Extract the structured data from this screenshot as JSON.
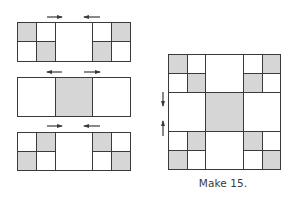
{
  "colors": {
    "line": "#3a3a3a",
    "fill_gray": "#d6d6d6",
    "fill_white": "#ffffff"
  },
  "rows": [
    {
      "name": "row-1",
      "cells": [
        {
          "x": 17,
          "y": 22,
          "w": 19,
          "h": 19,
          "fill": "gray"
        },
        {
          "x": 36,
          "y": 22,
          "w": 19,
          "h": 19,
          "fill": "white"
        },
        {
          "x": 17,
          "y": 41,
          "w": 19,
          "h": 20,
          "fill": "white"
        },
        {
          "x": 36,
          "y": 41,
          "w": 19,
          "h": 20,
          "fill": "gray"
        },
        {
          "x": 55,
          "y": 22,
          "w": 37,
          "h": 39,
          "fill": "white"
        },
        {
          "x": 92,
          "y": 22,
          "w": 19,
          "h": 19,
          "fill": "white"
        },
        {
          "x": 111,
          "y": 22,
          "w": 19,
          "h": 19,
          "fill": "gray"
        },
        {
          "x": 92,
          "y": 41,
          "w": 19,
          "h": 20,
          "fill": "gray"
        },
        {
          "x": 111,
          "y": 41,
          "w": 19,
          "h": 20,
          "fill": "white"
        }
      ],
      "arrows": [
        {
          "x1": 47,
          "y1": 17,
          "x2": 62,
          "y2": 17,
          "direction": "right"
        },
        {
          "x1": 100,
          "y1": 17,
          "x2": 84,
          "y2": 17,
          "direction": "left"
        }
      ]
    },
    {
      "name": "row-2",
      "cells": [
        {
          "x": 17,
          "y": 77,
          "w": 38,
          "h": 39,
          "fill": "white"
        },
        {
          "x": 55,
          "y": 77,
          "w": 37,
          "h": 39,
          "fill": "gray"
        },
        {
          "x": 92,
          "y": 77,
          "w": 38,
          "h": 39,
          "fill": "white"
        }
      ],
      "arrows": [
        {
          "x1": 62,
          "y1": 72,
          "x2": 47,
          "y2": 72,
          "direction": "left"
        },
        {
          "x1": 84,
          "y1": 72,
          "x2": 100,
          "y2": 72,
          "direction": "right"
        }
      ]
    },
    {
      "name": "row-3",
      "cells": [
        {
          "x": 17,
          "y": 132,
          "w": 19,
          "h": 19,
          "fill": "white"
        },
        {
          "x": 36,
          "y": 132,
          "w": 19,
          "h": 19,
          "fill": "gray"
        },
        {
          "x": 17,
          "y": 151,
          "w": 19,
          "h": 19,
          "fill": "gray"
        },
        {
          "x": 36,
          "y": 151,
          "w": 19,
          "h": 19,
          "fill": "white"
        },
        {
          "x": 55,
          "y": 132,
          "w": 37,
          "h": 38,
          "fill": "white"
        },
        {
          "x": 92,
          "y": 132,
          "w": 19,
          "h": 19,
          "fill": "gray"
        },
        {
          "x": 111,
          "y": 132,
          "w": 19,
          "h": 19,
          "fill": "white"
        },
        {
          "x": 92,
          "y": 151,
          "w": 19,
          "h": 19,
          "fill": "white"
        },
        {
          "x": 111,
          "y": 151,
          "w": 19,
          "h": 19,
          "fill": "gray"
        }
      ],
      "arrows": [
        {
          "x1": 47,
          "y1": 126,
          "x2": 62,
          "y2": 126,
          "direction": "right"
        },
        {
          "x1": 100,
          "y1": 126,
          "x2": 84,
          "y2": 126,
          "direction": "left"
        }
      ]
    },
    {
      "name": "assembled-block",
      "cells": [
        {
          "x": 168,
          "y": 54,
          "w": 19,
          "h": 19,
          "fill": "gray"
        },
        {
          "x": 187,
          "y": 54,
          "w": 18,
          "h": 19,
          "fill": "white"
        },
        {
          "x": 168,
          "y": 73,
          "w": 19,
          "h": 19,
          "fill": "white"
        },
        {
          "x": 187,
          "y": 73,
          "w": 18,
          "h": 19,
          "fill": "gray"
        },
        {
          "x": 205,
          "y": 54,
          "w": 38,
          "h": 38,
          "fill": "white"
        },
        {
          "x": 243,
          "y": 54,
          "w": 19,
          "h": 19,
          "fill": "white"
        },
        {
          "x": 262,
          "y": 54,
          "w": 18,
          "h": 19,
          "fill": "gray"
        },
        {
          "x": 243,
          "y": 73,
          "w": 19,
          "h": 19,
          "fill": "gray"
        },
        {
          "x": 262,
          "y": 73,
          "w": 18,
          "h": 19,
          "fill": "white"
        },
        {
          "x": 168,
          "y": 92,
          "w": 37,
          "h": 39,
          "fill": "white"
        },
        {
          "x": 205,
          "y": 92,
          "w": 38,
          "h": 39,
          "fill": "gray"
        },
        {
          "x": 243,
          "y": 92,
          "w": 37,
          "h": 39,
          "fill": "white"
        },
        {
          "x": 168,
          "y": 131,
          "w": 19,
          "h": 19,
          "fill": "white"
        },
        {
          "x": 187,
          "y": 131,
          "w": 18,
          "h": 19,
          "fill": "gray"
        },
        {
          "x": 168,
          "y": 150,
          "w": 19,
          "h": 19,
          "fill": "gray"
        },
        {
          "x": 187,
          "y": 150,
          "w": 18,
          "h": 19,
          "fill": "white"
        },
        {
          "x": 205,
          "y": 131,
          "w": 38,
          "h": 38,
          "fill": "white"
        },
        {
          "x": 243,
          "y": 131,
          "w": 19,
          "h": 19,
          "fill": "gray"
        },
        {
          "x": 262,
          "y": 131,
          "w": 18,
          "h": 19,
          "fill": "white"
        },
        {
          "x": 243,
          "y": 150,
          "w": 19,
          "h": 19,
          "fill": "white"
        },
        {
          "x": 262,
          "y": 150,
          "w": 18,
          "h": 19,
          "fill": "gray"
        }
      ],
      "arrows": [
        {
          "x1": 163,
          "y1": 92,
          "x2": 163,
          "y2": 106,
          "direction": "down"
        },
        {
          "x1": 163,
          "y1": 136,
          "x2": 163,
          "y2": 121,
          "direction": "up"
        }
      ]
    }
  ],
  "caption": "Make 15."
}
